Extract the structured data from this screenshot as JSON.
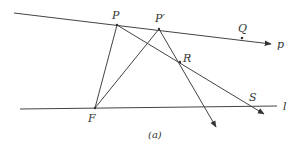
{
  "diagram": {
    "caption": "(a)",
    "lines": {
      "p": {
        "label": "p",
        "from": [
          14,
          13
        ],
        "to": [
          272,
          44
        ]
      },
      "l": {
        "label": "l",
        "from": [
          20,
          109
        ],
        "to": [
          277,
          106
        ]
      }
    },
    "points": {
      "P": {
        "label": "P",
        "x": 117,
        "y": 25
      },
      "P_prime": {
        "label": "P′",
        "x": 159,
        "y": 29
      },
      "Q": {
        "label": "Q",
        "x": 242,
        "y": 38
      },
      "R": {
        "label": "R",
        "x": 180,
        "y": 62
      },
      "F": {
        "label": "F",
        "x": 95,
        "y": 108
      },
      "S": {
        "label": "S",
        "x": 248,
        "y": 105
      }
    },
    "segments": [
      {
        "name": "F-P",
        "from": "F",
        "to": "P"
      },
      {
        "name": "F-P'",
        "from": "F",
        "to": "P'"
      },
      {
        "name": "P-S ray",
        "from": "P",
        "to_arrow": [
          265,
          114
        ]
      },
      {
        "name": "P'-R ray",
        "from": "P'",
        "to_arrow": [
          217,
          128
        ]
      }
    ]
  }
}
